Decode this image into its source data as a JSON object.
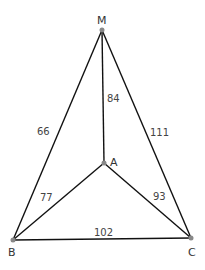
{
  "diagram": {
    "type": "weighted graph",
    "nodes": [
      {
        "id": "M",
        "label": "M",
        "x": 102,
        "y": 30
      },
      {
        "id": "A",
        "label": "A",
        "x": 104,
        "y": 163
      },
      {
        "id": "B",
        "label": "B",
        "x": 13,
        "y": 240
      },
      {
        "id": "C",
        "label": "C",
        "x": 191,
        "y": 238
      }
    ],
    "edges": [
      {
        "from": "M",
        "to": "B",
        "weight": "66"
      },
      {
        "from": "M",
        "to": "A",
        "weight": "84"
      },
      {
        "from": "M",
        "to": "C",
        "weight": "111"
      },
      {
        "from": "A",
        "to": "B",
        "weight": "77"
      },
      {
        "from": "A",
        "to": "C",
        "weight": "93"
      },
      {
        "from": "B",
        "to": "C",
        "weight": "102"
      }
    ]
  },
  "labels": {
    "M": "M",
    "A": "A",
    "B": "B",
    "C": "C",
    "MB": "66",
    "MA": "84",
    "MC": "111",
    "AB": "77",
    "AC": "93",
    "BC": "102"
  }
}
